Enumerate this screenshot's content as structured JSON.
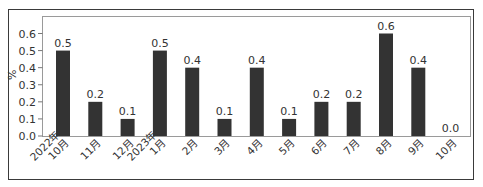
{
  "chart_data": {
    "type": "bar",
    "title": "",
    "xlabel": "",
    "ylabel": "%",
    "ylim": [
      0,
      0.6
    ],
    "yticks": [
      "0.0",
      "0.1",
      "0.2",
      "0.3",
      "0.4",
      "0.5",
      "0.6"
    ],
    "categories": [
      "2022年\n10月",
      "11月",
      "12月",
      "2023年\n1月",
      "2月",
      "3月",
      "4月",
      "5月",
      "6月",
      "7月",
      "8月",
      "9月",
      "10月"
    ],
    "values": [
      0.5,
      0.2,
      0.1,
      0.5,
      0.4,
      0.1,
      0.4,
      0.1,
      0.2,
      0.2,
      0.6,
      0.4,
      0.0
    ],
    "value_labels": [
      "0.5",
      "0.2",
      "0.1",
      "0.5",
      "0.4",
      "0.1",
      "0.4",
      "0.1",
      "0.2",
      "0.2",
      "0.6",
      "0.4",
      "0.0"
    ],
    "grid": false,
    "legend": null,
    "bar_color": "#333333"
  }
}
